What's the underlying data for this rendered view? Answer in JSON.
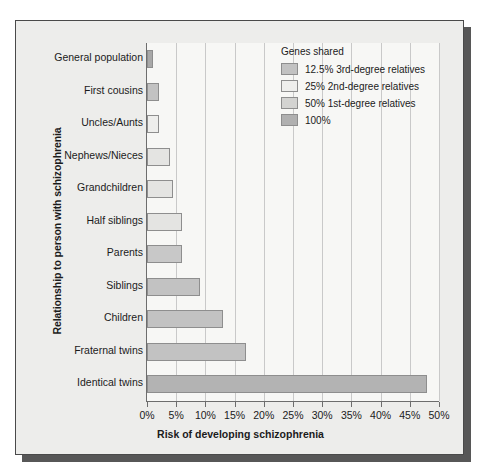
{
  "figure": {
    "panel_bg": "#ededeb",
    "plot_bg": "#f7f7f5",
    "frame_color": "#4a4a4a",
    "shadow_color": "#575757",
    "grid_color": "#c9c9c9",
    "axis_color": "#6d6d6d",
    "bar_border": "#8e8e8e"
  },
  "chart_data": {
    "type": "bar",
    "orientation": "horizontal",
    "title": "",
    "xlabel": "Risk of developing schizophrenia",
    "ylabel": "Relationship to person with schizophrenia",
    "xlim": [
      0,
      50
    ],
    "xtick_labels": [
      "0%",
      "5%",
      "10%",
      "15%",
      "20%",
      "25%",
      "30%",
      "35%",
      "40%",
      "45%",
      "50%"
    ],
    "xticks": [
      0,
      5,
      10,
      15,
      20,
      25,
      30,
      35,
      40,
      45,
      50
    ],
    "grid": "vertical",
    "legend_position": "top-right",
    "categories": [
      "General population",
      "First cousins",
      "Uncles/Aunts",
      "Nephews/Nieces",
      "Grandchildren",
      "Half siblings",
      "Parents",
      "Siblings",
      "Children",
      "Fraternal twins",
      "Identical twins"
    ],
    "values": [
      1,
      2,
      2,
      4,
      4.5,
      6,
      6,
      9,
      13,
      17,
      48
    ],
    "value_units": "%",
    "bar_group": [
      "100%",
      "12.5% 3rd-degree relatives",
      "25% 2nd-degree relatives",
      "25% 2nd-degree relatives",
      "25% 2nd-degree relatives",
      "25% 2nd-degree relatives",
      "50% 1st-degree relatives",
      "50% 1st-degree relatives",
      "50% 1st-degree relatives",
      "50% 1st-degree relatives",
      "100%"
    ],
    "bar_colors": [
      "#a8a8a8",
      "#c2c2c2",
      "#eeeeec",
      "#e4e4e2",
      "#e4e4e2",
      "#e4e4e2",
      "#c8c8c8",
      "#c2c2c2",
      "#c2c2c2",
      "#c2c2c2",
      "#b3b3b3"
    ]
  },
  "legend": {
    "title": "Genes shared",
    "items": [
      {
        "label": "12.5% 3rd-degree relatives",
        "color": "#c2c2c2"
      },
      {
        "label": "25% 2nd-degree relatives",
        "color": "#eeeeec"
      },
      {
        "label": "50% 1st-degree relatives",
        "color": "#d3d3d1"
      },
      {
        "label": "100%",
        "color": "#b0b0b0"
      }
    ]
  }
}
